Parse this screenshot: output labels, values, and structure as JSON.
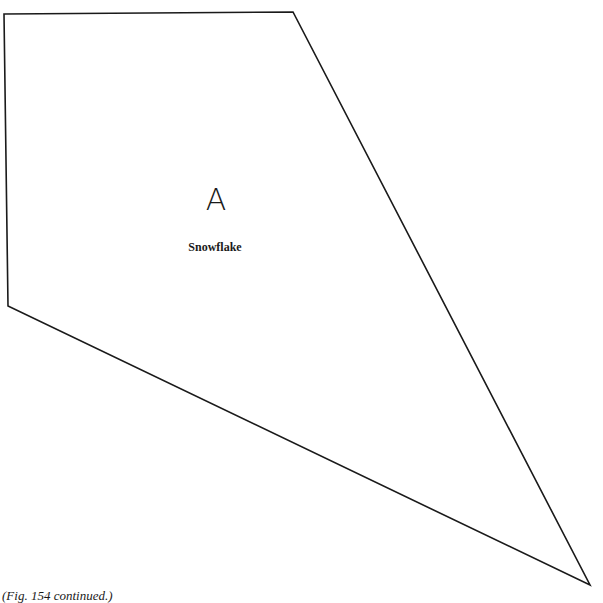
{
  "piece": {
    "letter": "A",
    "name": "Snowflake",
    "outline_color": "#1a1a1a",
    "vertices": [
      [
        4,
        14
      ],
      [
        293,
        12
      ],
      [
        590,
        585
      ],
      [
        8,
        306
      ]
    ]
  },
  "caption": "(Fig. 154 continued.)"
}
